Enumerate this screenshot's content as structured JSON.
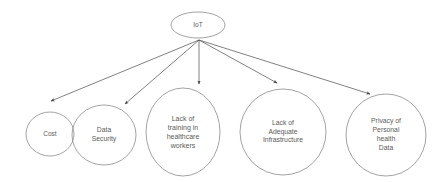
{
  "diagram": {
    "type": "radial-tree",
    "style": {
      "stroke_color": "#8c8c8c",
      "root_stroke_color": "#8c8c8c",
      "arrow_color": "#4a4a4a",
      "text_color": "#5a5a5a",
      "background": "#ffffff"
    },
    "root": {
      "id": "iot",
      "label": "IoT",
      "font_size": "6.5px",
      "cx": 198,
      "cy": 25,
      "rx": 27,
      "ry": 13
    },
    "fan_origin": {
      "x": 199,
      "y": 40
    },
    "children": [
      {
        "id": "cost",
        "label": "Cost",
        "font_size": "6.5px",
        "cx": 50,
        "cy": 134,
        "rx": 24,
        "ry": 22,
        "arrow": {
          "x1": 199,
          "y1": 40,
          "x2": 51,
          "y2": 101
        }
      },
      {
        "id": "data-security",
        "label": "Data\nSecurity",
        "font_size": "6.8px",
        "cx": 104,
        "cy": 135,
        "rx": 32,
        "ry": 30,
        "arrow": {
          "x1": 199,
          "y1": 40,
          "x2": 125,
          "y2": 104
        }
      },
      {
        "id": "lack-of-training",
        "label": "Lack of\ntraining in\nhealthcare\nworkers",
        "font_size": "7px",
        "cx": 183,
        "cy": 132,
        "rx": 37,
        "ry": 44,
        "arrow": {
          "x1": 199,
          "y1": 40,
          "x2": 199,
          "y2": 84
        }
      },
      {
        "id": "lack-of-infrastructure",
        "label": "Lack of\nAdequate\nInfrastructure",
        "font_size": "6.8px",
        "cx": 283,
        "cy": 132,
        "rx": 43,
        "ry": 43,
        "arrow": {
          "x1": 199,
          "y1": 40,
          "x2": 277,
          "y2": 83
        }
      },
      {
        "id": "privacy-personal-health-data",
        "label": "Privacy of\nPersonal\nhealth\nData",
        "font_size": "6.8px",
        "cx": 386,
        "cy": 135,
        "rx": 40,
        "ry": 41,
        "arrow": {
          "x1": 199,
          "y1": 40,
          "x2": 370,
          "y2": 94
        }
      }
    ]
  }
}
